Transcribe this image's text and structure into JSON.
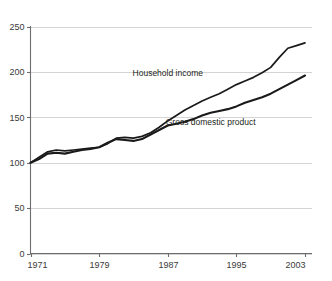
{
  "chart_data": {
    "type": "line",
    "title": "",
    "subtitle": "",
    "xlabel": "",
    "ylabel": "",
    "xlim": [
      1971,
      2003
    ],
    "ylim": [
      0,
      250
    ],
    "grid": true,
    "legend_position": "inline-annotations",
    "ytick_labels": [
      "0",
      "50",
      "100",
      "150",
      "200",
      "250"
    ],
    "ytick_values": [
      0,
      50,
      100,
      150,
      200,
      250
    ],
    "xtick_labels": [
      "1971",
      "1979",
      "1987",
      "1995",
      "2003"
    ],
    "xtick_values": [
      1971,
      1979,
      1987,
      1995,
      2003
    ],
    "x": [
      1971,
      1972,
      1973,
      1974,
      1975,
      1976,
      1977,
      1978,
      1979,
      1980,
      1981,
      1982,
      1983,
      1984,
      1985,
      1986,
      1987,
      1988,
      1989,
      1990,
      1991,
      1992,
      1993,
      1994,
      1995,
      1996,
      1997,
      1998,
      1999,
      2000,
      2001,
      2002,
      2003
    ],
    "series": [
      {
        "name": "Household income",
        "label": "Household income",
        "color": "#1a1a1a",
        "values": [
          100,
          106,
          112,
          114,
          113,
          114,
          115,
          116,
          117,
          121,
          127,
          128,
          127,
          129,
          133,
          139,
          146,
          152,
          158,
          163,
          168,
          172,
          176,
          181,
          186,
          190,
          194,
          199,
          205,
          216,
          226,
          229,
          232
        ]
      },
      {
        "name": "Gross domestic product",
        "label": "Gross domestic product",
        "color": "#1a1a1a",
        "values": [
          100,
          104,
          110,
          111,
          110,
          112,
          114,
          115,
          117,
          122,
          126,
          125,
          124,
          126,
          131,
          136,
          141,
          143,
          145,
          148,
          152,
          155,
          157,
          159,
          162,
          166,
          169,
          172,
          176,
          181,
          186,
          191,
          196
        ]
      }
    ],
    "annotations": [
      {
        "text": "Household income",
        "x": 1987,
        "y": 196
      },
      {
        "text": "Gross domestic product",
        "x": 1992,
        "y": 142
      }
    ]
  },
  "labels": {
    "household_income": "Household income",
    "gross_domestic_product": "Gross domestic product"
  }
}
